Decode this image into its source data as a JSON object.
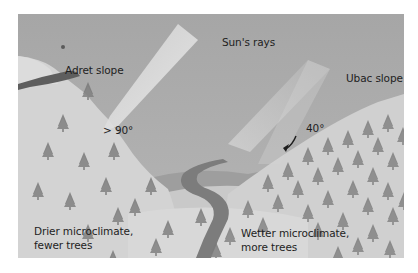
{
  "diagram": {
    "labels": {
      "sun_rays": "Sun's rays",
      "adret_slope": "Adret slope",
      "ubac_slope": "Ubac slope",
      "adret_angle": "> 90°",
      "ubac_angle": "40°",
      "adret_description_line1": "Drier microclimate,",
      "adret_description_line2": "fewer trees",
      "ubac_description_line1": "Wetter microclimate,",
      "ubac_description_line2": "more trees"
    },
    "colors": {
      "sky": "#a9a9a9",
      "sky_light": "#b8b8b8",
      "slope_light": "#d6d6d6",
      "slope_mid": "#c4c4c4",
      "sun_ray": "#e2e2e2",
      "river": "#7c7c7c",
      "tree": "#7a7a7a",
      "text": "#1e1e1e"
    }
  }
}
